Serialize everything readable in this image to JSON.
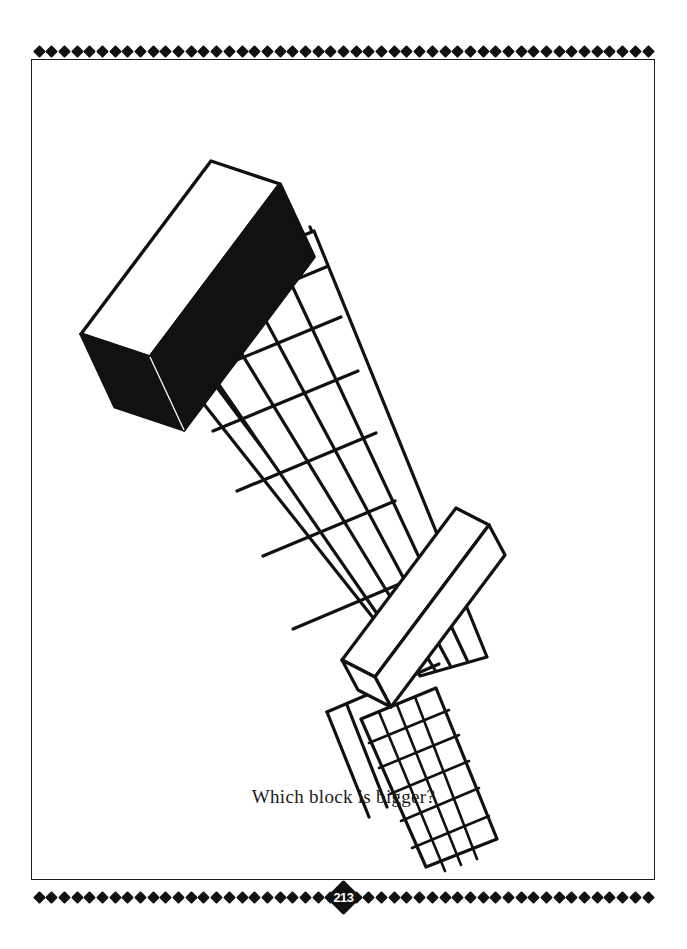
{
  "page": {
    "background_color": "#ffffff",
    "ink_color": "#111111",
    "width": 687,
    "height": 949,
    "number": "213"
  },
  "border": {
    "ornament_icon": "diamond-icon",
    "ornament_count_top": 49,
    "ornament_count_bottom": 49,
    "frame_color": "#1a1a1a"
  },
  "caption": {
    "text": "Which block is bigger?"
  },
  "figure": {
    "name": "perspective-corridor-block-illusion",
    "alt": "Two identical blocks placed on a receding tiled corridor; the far block appears smaller.",
    "near_block": {
      "label": "near-block",
      "top_face_fill": "#ffffff",
      "side_face_fill": "#111111",
      "stroke": "#111111"
    },
    "far_block": {
      "label": "far-block",
      "top_face_fill": "#ffffff",
      "side_face_fill": "#ffffff",
      "stroke": "#111111"
    },
    "corridor": {
      "label": "tiled-corridor",
      "fill": "#ffffff",
      "stroke": "#111111",
      "tile_rows": 9
    }
  }
}
